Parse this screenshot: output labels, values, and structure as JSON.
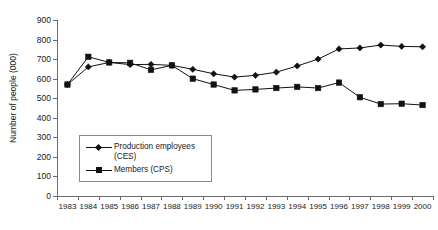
{
  "chart_data": {
    "type": "line",
    "title": "",
    "xlabel": "",
    "ylabel": "Number of people (000)",
    "ylim": [
      0,
      900
    ],
    "ytick_step": 100,
    "yticks": [
      0,
      100,
      200,
      300,
      400,
      500,
      600,
      700,
      800,
      900
    ],
    "ytick_labels": [
      "0",
      "100",
      "200",
      "300",
      "400",
      "500",
      "600",
      "700",
      "800",
      "900"
    ],
    "grid": false,
    "legend_position": "inside-lower-left",
    "categories": [
      "1983",
      "1984",
      "1985",
      "1986",
      "1987",
      "1988",
      "1989",
      "1990",
      "1991",
      "1992",
      "1993",
      "1994",
      "1995",
      "1996",
      "1997",
      "1998",
      "1999",
      "2000"
    ],
    "x": [
      1983,
      1984,
      1985,
      1986,
      1987,
      1988,
      1989,
      1990,
      1991,
      1992,
      1993,
      1994,
      1995,
      1996,
      1997,
      1998,
      1999,
      2000
    ],
    "series": [
      {
        "name": "Production employees (CES)",
        "marker": "diamond",
        "color": "#111111",
        "values": [
          570,
          660,
          683,
          672,
          673,
          668,
          648,
          625,
          608,
          617,
          633,
          665,
          700,
          752,
          757,
          772,
          765,
          763
        ]
      },
      {
        "name": "Members (CPS)",
        "marker": "square",
        "color": "#111111",
        "values": [
          570,
          712,
          683,
          681,
          645,
          668,
          600,
          570,
          540,
          545,
          552,
          558,
          552,
          580,
          505,
          470,
          472,
          465
        ]
      }
    ]
  },
  "legend": {
    "entries": [
      {
        "label": "Production employees (CES)",
        "marker": "diamond"
      },
      {
        "label": "Members (CPS)",
        "marker": "square"
      }
    ]
  },
  "axes": {
    "y_title": "Number of people (000)"
  }
}
